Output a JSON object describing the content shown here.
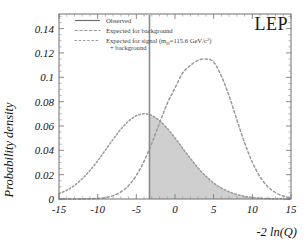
{
  "figure": {
    "experiment_label": "LEP",
    "background_color": "#ffffff",
    "curve_color": "#9a9a9a",
    "shade_color": "#cfcfcf",
    "observed_line_color": "#8c8c8c"
  },
  "axes": {
    "x_title": "-2 ln(Q)",
    "y_title": "Probability density",
    "x_ticks": [
      "-15",
      "-10",
      "-5",
      "0",
      "5",
      "10",
      "15"
    ],
    "y_ticks": [
      "0",
      "0.02",
      "0.04",
      "0.06",
      "0.08",
      "0.1",
      "0.12",
      "0.14"
    ]
  },
  "legend": {
    "items": [
      {
        "label": "Observed",
        "style": "solid"
      },
      {
        "label": "Expected for background",
        "style": "dotted"
      },
      {
        "label": "Expected for signal (m",
        "style": "dotted",
        "sub": "H",
        "tail": "=115.6 GeV/c",
        "sup": "2",
        "close": ")",
        "line2": "+ background"
      }
    ]
  },
  "chart_data": {
    "type": "line",
    "title": "",
    "xlabel": "-2 ln(Q)",
    "ylabel": "Probability density",
    "xlim": [
      -15,
      15
    ],
    "ylim": [
      0,
      0.152
    ],
    "grid": false,
    "legend_position": "top-left",
    "annotations": [
      {
        "text": "LEP",
        "x": 12.5,
        "y": 0.145
      }
    ],
    "observed_value": -3.3,
    "shaded_region": {
      "series": "Expected for signal (m_H=115.6 GeV/c^2) + background",
      "from_x": -3.3,
      "to_x": 15,
      "color": "#cfcfcf",
      "meaning": "tail of signal+background expectation above the observed value"
    },
    "series": [
      {
        "name": "Expected for signal (m_H=115.6 GeV/c^2) + background",
        "style": "dotted",
        "peak_x": -4.7,
        "peak_y": 0.084,
        "sigma": 4.9,
        "x": [
          -15,
          -14,
          -13,
          -12,
          -11,
          -10,
          -9,
          -8,
          -7,
          -6,
          -5,
          -4,
          -3,
          -2,
          -1,
          0,
          1,
          2,
          3,
          4,
          5,
          6,
          7,
          8,
          9,
          10,
          11,
          12,
          13,
          14,
          15
        ],
        "y": [
          0.0044,
          0.0072,
          0.0112,
          0.0166,
          0.0234,
          0.0314,
          0.0402,
          0.0491,
          0.0573,
          0.064,
          0.0684,
          0.07,
          0.0686,
          0.0644,
          0.058,
          0.0501,
          0.0416,
          0.0332,
          0.0254,
          0.0187,
          0.0132,
          0.009,
          0.0059,
          0.0037,
          0.0022,
          0.0013,
          0.0007,
          0.0004,
          0.0002,
          0.0001,
          0.0001
        ]
      },
      {
        "name": "Expected for background",
        "style": "dotted",
        "peak_x": 3.8,
        "peak_y": 0.115,
        "sigma": 3.6,
        "x": [
          -15,
          -14,
          -13,
          -12,
          -11,
          -10,
          -9,
          -8,
          -7,
          -6,
          -5,
          -4,
          -3,
          -2,
          -1,
          0,
          1,
          2,
          3,
          4,
          5,
          6,
          7,
          8,
          9,
          10,
          11,
          12,
          13,
          14,
          15
        ],
        "y": [
          0.0,
          0.0,
          0.0,
          0.0001,
          0.0002,
          0.0005,
          0.0012,
          0.0028,
          0.0058,
          0.011,
          0.0193,
          0.031,
          0.0458,
          0.0624,
          0.0785,
          0.0912,
          0.1036,
          0.1098,
          0.114,
          0.115,
          0.1125,
          0.101,
          0.0846,
          0.0651,
          0.0462,
          0.0302,
          0.0182,
          0.0101,
          0.0052,
          0.0024,
          0.0011
        ]
      }
    ]
  }
}
